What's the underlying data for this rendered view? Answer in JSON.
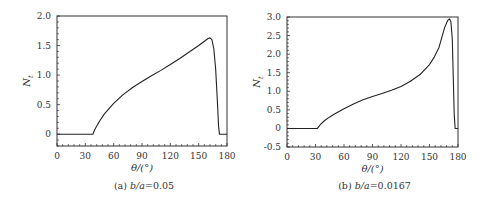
{
  "chart_data": [
    {
      "type": "line",
      "caption": "(a) b/a=0.05",
      "caption_prefix": "(a) ",
      "caption_var": "b/a",
      "caption_value": "=0.05",
      "xlabel": "θ/(°)",
      "ylabel": "N_t",
      "xlim": [
        0,
        180
      ],
      "ylim": [
        -0.2,
        2.0
      ],
      "xticks": [
        0,
        30,
        60,
        90,
        120,
        150,
        180
      ],
      "yticks": [
        0,
        0.5,
        1.0,
        1.5,
        2.0
      ],
      "ytick_labels": [
        "0",
        "0.5",
        "1.0",
        "1.5",
        "2.0"
      ],
      "grid": false,
      "series": [
        {
          "name": "N_t",
          "color": "#222222",
          "x": [
            0,
            38,
            40,
            45,
            50,
            60,
            70,
            80,
            90,
            100,
            110,
            120,
            130,
            140,
            150,
            155,
            160,
            162,
            164,
            166,
            168,
            170,
            171,
            172,
            180
          ],
          "y": [
            0,
            0,
            0.08,
            0.22,
            0.34,
            0.52,
            0.67,
            0.79,
            0.89,
            0.99,
            1.08,
            1.18,
            1.28,
            1.39,
            1.5,
            1.56,
            1.62,
            1.63,
            1.6,
            1.45,
            1.1,
            0.5,
            0.15,
            0,
            0
          ]
        }
      ],
      "frame": {
        "x0": 57,
        "x1": 227,
        "y0": 16,
        "y1": 146
      }
    },
    {
      "type": "line",
      "caption": "(b) b/a=0.0167",
      "caption_prefix": "(b) ",
      "caption_var": "b/a",
      "caption_value": "=0.0167",
      "xlabel": "θ/(°)",
      "ylabel": "N_t",
      "xlim": [
        0,
        180
      ],
      "ylim": [
        -0.5,
        3.0
      ],
      "xticks": [
        0,
        30,
        60,
        90,
        120,
        150,
        180
      ],
      "yticks": [
        -0.5,
        0,
        0.5,
        1.0,
        1.5,
        2.0,
        2.5,
        3.0
      ],
      "ytick_labels": [
        "-0.5",
        "0",
        "0.5",
        "1.0",
        "1.5",
        "2.0",
        "2.5",
        "3.0"
      ],
      "grid": false,
      "series": [
        {
          "name": "N_t",
          "color": "#222222",
          "x": [
            0,
            32,
            35,
            40,
            45,
            50,
            60,
            70,
            80,
            90,
            100,
            110,
            120,
            130,
            140,
            150,
            155,
            160,
            163,
            166,
            169,
            171,
            172.5,
            174,
            175,
            176,
            177,
            178,
            180
          ],
          "y": [
            0,
            0,
            0.1,
            0.22,
            0.31,
            0.39,
            0.53,
            0.66,
            0.77,
            0.86,
            0.94,
            1.03,
            1.13,
            1.27,
            1.45,
            1.72,
            1.92,
            2.18,
            2.45,
            2.72,
            2.9,
            2.95,
            2.88,
            2.4,
            1.4,
            0.4,
            0,
            0,
            0
          ]
        }
      ],
      "frame": {
        "x0": 287,
        "x1": 458,
        "y0": 17,
        "y1": 147
      }
    }
  ]
}
